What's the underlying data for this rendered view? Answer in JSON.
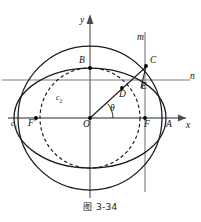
{
  "figure": {
    "caption": "图 3-34",
    "axes": {
      "x_label": "x",
      "y_label": "y"
    },
    "lines": [
      {
        "name": "m",
        "label": "m",
        "orientation": "vertical"
      },
      {
        "name": "n",
        "label": "n",
        "orientation": "horizontal"
      }
    ],
    "curves": [
      {
        "name": "c1",
        "label": "c",
        "sub": "1",
        "style": "solid",
        "shape": "circle"
      },
      {
        "name": "c2",
        "label": "c",
        "sub": "2",
        "style": "dashed",
        "shape": "circle"
      },
      {
        "name": "ellipse",
        "label": "",
        "style": "solid",
        "shape": "ellipse"
      }
    ],
    "angle": {
      "label": "θ"
    },
    "points": [
      {
        "name": "O",
        "label": "O"
      },
      {
        "name": "A",
        "label": "A"
      },
      {
        "name": "B",
        "label": "B"
      },
      {
        "name": "C",
        "label": "C"
      },
      {
        "name": "D",
        "label": "D"
      },
      {
        "name": "E",
        "label": "E"
      },
      {
        "name": "F",
        "label": "F"
      },
      {
        "name": "F-prime",
        "label": "F'"
      }
    ],
    "colors": {
      "curve": "#1a1a1a",
      "axis": "#6e6e6e",
      "background": "#ffffff"
    }
  }
}
